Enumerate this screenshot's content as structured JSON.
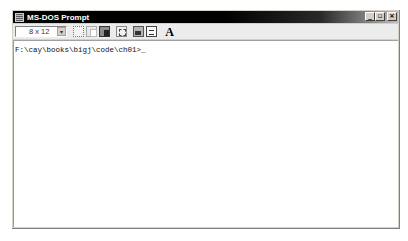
{
  "window": {
    "title": "MS-DOS Prompt",
    "title_icon": "ms-dos-icon",
    "controls": {
      "minimize_glyph": "_",
      "restore_glyph": "▫",
      "close_glyph": "×"
    }
  },
  "toolbar": {
    "font_size": "8 x 12",
    "font_dropdown_glyph": "▾",
    "tools": [
      {
        "name": "mark-icon"
      },
      {
        "name": "copy-icon"
      },
      {
        "name": "paste-icon"
      },
      {
        "name": "full-screen-icon"
      },
      {
        "name": "properties-icon"
      },
      {
        "name": "background-icon"
      },
      {
        "name": "font-icon",
        "label": "A"
      }
    ]
  },
  "console": {
    "prompt": "F:\\cay\\books\\bigj\\code\\ch01>",
    "cursor": "_"
  },
  "colors": {
    "titlebar": "#000000",
    "window_face": "#d4d0c8",
    "console_bg": "#ffffff",
    "text": "#111111"
  }
}
